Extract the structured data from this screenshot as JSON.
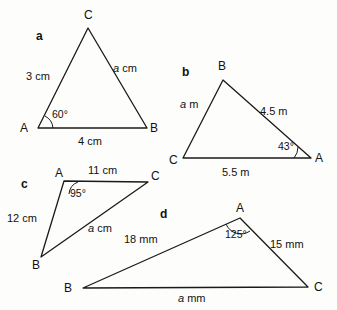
{
  "page": {
    "background_color": "#fdfdfc",
    "line_color": "#1a1a1a",
    "text_color": "#111111"
  },
  "figures": [
    {
      "key": "a",
      "label": "a",
      "vertices": [
        {
          "name": "C",
          "label": "C"
        },
        {
          "name": "A",
          "label": "A"
        },
        {
          "name": "B",
          "label": "B"
        }
      ],
      "sides": [
        {
          "name": "side-AC",
          "label_text": "3 cm",
          "variable": "",
          "unit_text": "3 cm"
        },
        {
          "name": "side-CB",
          "label_text": "a cm",
          "variable": "a",
          "unit_text": " cm"
        },
        {
          "name": "side-AB",
          "label_text": "4 cm",
          "variable": "",
          "unit_text": "4 cm"
        }
      ],
      "angles": [
        {
          "at": "A",
          "label": "60°"
        }
      ]
    },
    {
      "key": "b",
      "label": "b",
      "vertices": [
        {
          "name": "B",
          "label": "B"
        },
        {
          "name": "C",
          "label": "C"
        },
        {
          "name": "A",
          "label": "A"
        }
      ],
      "sides": [
        {
          "name": "side-CB",
          "label_text": "a m",
          "variable": "a",
          "unit_text": " m"
        },
        {
          "name": "side-BA",
          "label_text": "4.5 m",
          "variable": "",
          "unit_text": "4.5 m"
        },
        {
          "name": "side-CA",
          "label_text": "5.5 m",
          "variable": "",
          "unit_text": "5.5 m"
        }
      ],
      "angles": [
        {
          "at": "A",
          "label": "43°"
        }
      ]
    },
    {
      "key": "c",
      "label": "c",
      "vertices": [
        {
          "name": "A",
          "label": "A"
        },
        {
          "name": "C",
          "label": "C"
        },
        {
          "name": "B",
          "label": "B"
        }
      ],
      "sides": [
        {
          "name": "side-AC",
          "label_text": "11 cm",
          "variable": "",
          "unit_text": "11 cm"
        },
        {
          "name": "side-AB",
          "label_text": "12 cm",
          "variable": "",
          "unit_text": "12 cm"
        },
        {
          "name": "side-BC",
          "label_text": "a cm",
          "variable": "a",
          "unit_text": " cm"
        }
      ],
      "angles": [
        {
          "at": "A",
          "label": "95°"
        }
      ]
    },
    {
      "key": "d",
      "label": "d",
      "vertices": [
        {
          "name": "A",
          "label": "A"
        },
        {
          "name": "B",
          "label": "B"
        },
        {
          "name": "C",
          "label": "C"
        }
      ],
      "sides": [
        {
          "name": "side-AB",
          "label_text": "18 mm",
          "variable": "",
          "unit_text": "18 mm"
        },
        {
          "name": "side-AC",
          "label_text": "15 mm",
          "variable": "",
          "unit_text": "15 mm"
        },
        {
          "name": "side-BC",
          "label_text": "a mm",
          "variable": "a",
          "unit_text": " mm"
        }
      ],
      "angles": [
        {
          "at": "A",
          "label": "125°"
        }
      ]
    }
  ],
  "text": {
    "fig_a_letter": "a",
    "fig_a_vertex_C": "C",
    "fig_a_vertex_A": "A",
    "fig_a_vertex_B": "B",
    "fig_a_side_3cm": "3 cm",
    "fig_a_side_a_var": "a",
    "fig_a_side_a_unit": " cm",
    "fig_a_side_4cm": "4 cm",
    "fig_a_angle_60": "60°",
    "fig_b_letter": "b",
    "fig_b_vertex_B": "B",
    "fig_b_vertex_C": "C",
    "fig_b_vertex_A": "A",
    "fig_b_side_a_var": "a",
    "fig_b_side_a_unit": " m",
    "fig_b_side_45m": "4.5 m",
    "fig_b_side_55m": "5.5 m",
    "fig_b_angle_43": "43°",
    "fig_c_letter": "c",
    "fig_c_vertex_A": "A",
    "fig_c_vertex_C": "C",
    "fig_c_vertex_B": "B",
    "fig_c_side_11cm": "11 cm",
    "fig_c_side_12cm": "12 cm",
    "fig_c_side_a_var": "a",
    "fig_c_side_a_unit": " cm",
    "fig_c_angle_95": "95°",
    "fig_d_letter": "d",
    "fig_d_vertex_A": "A",
    "fig_d_vertex_B": "B",
    "fig_d_vertex_C": "C",
    "fig_d_side_18mm": "18 mm",
    "fig_d_side_15mm": "15 mm",
    "fig_d_side_a_var": "a",
    "fig_d_side_a_unit": " mm",
    "fig_d_angle_125": "125°"
  }
}
